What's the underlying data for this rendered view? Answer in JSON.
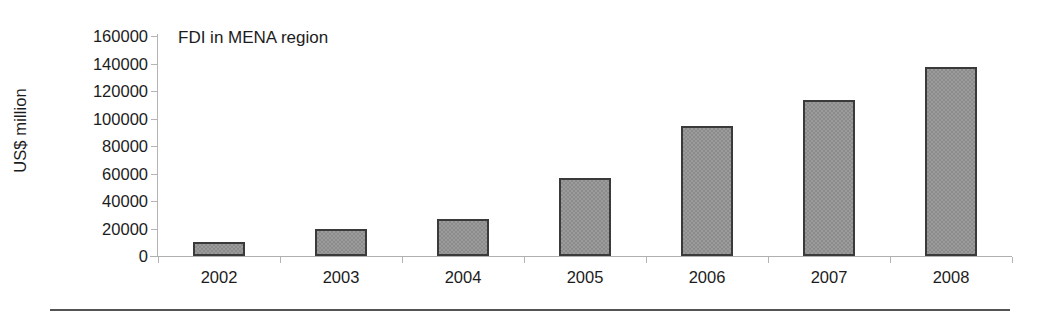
{
  "chart_data": {
    "type": "bar",
    "title": "FDI in MENA region",
    "xlabel": "",
    "ylabel": "US$ million",
    "categories": [
      "2002",
      "2003",
      "2004",
      "2005",
      "2006",
      "2007",
      "2008"
    ],
    "values": [
      10200,
      19800,
      27000,
      57000,
      94500,
      113500,
      137500
    ],
    "ylim": [
      0,
      160000
    ],
    "ytick_labels": [
      "0",
      "20000",
      "40000",
      "60000",
      "80000",
      "100000",
      "120000",
      "140000",
      "160000"
    ],
    "ytick_values": [
      0,
      20000,
      40000,
      60000,
      80000,
      100000,
      120000,
      140000,
      160000
    ],
    "ytick_step": 20000,
    "grid": false,
    "legend": false,
    "legend_position": "none",
    "series": [
      {
        "name": "FDI in MENA region",
        "values": [
          10200,
          19800,
          27000,
          57000,
          94500,
          113500,
          137500
        ]
      }
    ],
    "colors": {
      "bar_fill": "#9b9b9b",
      "bar_edge": "#3a3a3a",
      "axis": "#b4b4b4",
      "text": "#1c1c1c",
      "background": "#ffffff",
      "rule": "#545454"
    }
  }
}
